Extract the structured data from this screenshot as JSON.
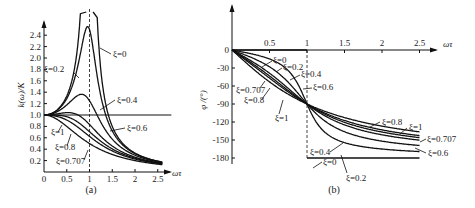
{
  "chart_data": [
    {
      "id": "a",
      "type": "line",
      "caption": "(a)",
      "title": "",
      "xlabel": "ωτ",
      "ylabel": "k(ω)/K",
      "xticks": [
        "0",
        "0.5",
        "1",
        "1.5",
        "2",
        "2.5"
      ],
      "yticks": [
        "0.2",
        "0.4",
        "0.6",
        "0.8",
        "1.0",
        "1.2",
        "1.4",
        "1.6",
        "1.8",
        "2.0",
        "2.2",
        "2.4"
      ],
      "xlim": [
        0,
        2.8
      ],
      "ylim": [
        0,
        2.6
      ],
      "grid": false,
      "reference_lines": [
        {
          "type": "vertical",
          "x": 1,
          "style": "dashed"
        },
        {
          "type": "horizontal",
          "y": 1.0,
          "style": "solid"
        }
      ],
      "series": [
        {
          "name": "ξ=0",
          "zeta": 0
        },
        {
          "name": "ξ=0.2",
          "zeta": 0.2
        },
        {
          "name": "ξ=0.4",
          "zeta": 0.4
        },
        {
          "name": "ξ=0.6",
          "zeta": 0.6
        },
        {
          "name": "ξ=0.707",
          "zeta": 0.707
        },
        {
          "name": "ξ=0.8",
          "zeta": 0.8
        },
        {
          "name": "ξ=1",
          "zeta": 1
        }
      ],
      "formula": "k(ω)/K = 1/sqrt((1-(ωτ)^2)^2 + (2ξωτ)^2)",
      "annotations": [
        "ξ=0",
        "ξ=0.2",
        "ξ=0.4",
        "ξ=0.6",
        "ξ=1",
        "ξ=0.8",
        "ξ=0.707"
      ]
    },
    {
      "id": "b",
      "type": "line",
      "caption": "(b)",
      "title": "",
      "xlabel": "ωτ",
      "ylabel": "φ /(°)",
      "xticks": [
        "0.5",
        "1",
        "1.5",
        "2",
        "2.5"
      ],
      "yticks": [
        "0",
        "-30",
        "-60",
        "-90",
        "-120",
        "-150",
        "-180"
      ],
      "xlim": [
        0,
        2.7
      ],
      "ylim": [
        -190,
        0
      ],
      "grid": false,
      "reference_lines": [
        {
          "type": "vertical",
          "x": 1,
          "style": "dashed"
        }
      ],
      "series": [
        {
          "name": "ξ=0",
          "zeta": 0
        },
        {
          "name": "ξ=0.2",
          "zeta": 0.2
        },
        {
          "name": "ξ=0.4",
          "zeta": 0.4
        },
        {
          "name": "ξ=0.6",
          "zeta": 0.6
        },
        {
          "name": "ξ=0.707",
          "zeta": 0.707
        },
        {
          "name": "ξ=0.8",
          "zeta": 0.8
        },
        {
          "name": "ξ=1",
          "zeta": 1
        }
      ],
      "formula": "φ = -arctan(2ξωτ/(1-(ωτ)^2))",
      "annotations": [
        "ξ=0",
        "ξ=0.2",
        "ξ=0.4",
        "ξ=0.6",
        "ξ=0.707",
        "ξ=0.8",
        "ξ=1",
        "ξ=0.8",
        "ξ=1",
        "ξ=0.707",
        "ξ=0.6",
        "ξ=0.4",
        "ξ=0",
        "ξ=0.2"
      ]
    }
  ],
  "labels": {
    "a": {
      "caption": "(a)",
      "xlabel": "ωτ",
      "ylabel": "k(ω)/K",
      "curve_labels": [
        {
          "text": "ξ=0",
          "x": 113,
          "y": 57,
          "lx1": 100,
          "ly1": 48,
          "lx2": 111,
          "ly2": 54
        },
        {
          "text": "ξ=0.2",
          "x": 44,
          "y": 72,
          "lx1": 73,
          "ly1": 72,
          "lx2": 79,
          "ly2": 78
        },
        {
          "text": "ξ=0.4",
          "x": 117,
          "y": 103,
          "lx1": 100,
          "ly1": 110,
          "lx2": 115,
          "ly2": 100
        },
        {
          "text": "ξ=0.6",
          "x": 127,
          "y": 131,
          "lx1": 110,
          "ly1": 131,
          "lx2": 125,
          "ly2": 128
        },
        {
          "text": "ξ=1",
          "x": 51,
          "y": 135,
          "lx1": 58,
          "ly1": 132,
          "lx2": 62,
          "ly2": 125
        },
        {
          "text": "ξ=0.8",
          "x": 55,
          "y": 150,
          "lx1": 67,
          "ly1": 146,
          "lx2": 71,
          "ly2": 134
        },
        {
          "text": "ξ=0.707",
          "x": 56,
          "y": 164,
          "lx1": 84,
          "ly1": 160,
          "lx2": 88,
          "ly2": 150
        }
      ]
    },
    "b": {
      "caption": "(b)",
      "xlabel": "ωτ",
      "ylabel": "φ /(°)",
      "curve_labels": [
        {
          "text": "ξ=0",
          "x": 273,
          "y": 63,
          "lx1": 262,
          "ly1": 67,
          "lx2": 272,
          "ly2": 61
        },
        {
          "text": "ξ=0.2",
          "x": 283,
          "y": 70,
          "lx1": 276,
          "ly1": 72,
          "lx2": 282,
          "ly2": 68
        },
        {
          "text": "ξ=0.4",
          "x": 301,
          "y": 77,
          "lx1": 290,
          "ly1": 80,
          "lx2": 300,
          "ly2": 75
        },
        {
          "text": "ξ=0.6",
          "x": 313,
          "y": 90,
          "lx1": 303,
          "ly1": 89,
          "lx2": 312,
          "ly2": 88
        },
        {
          "text": "ξ=0.707",
          "x": 236,
          "y": 93,
          "lx1": 260,
          "ly1": 88,
          "lx2": 265,
          "ly2": 81
        },
        {
          "text": "ξ=0.8",
          "x": 244,
          "y": 103,
          "lx1": 262,
          "ly1": 99,
          "lx2": 270,
          "ly2": 88
        },
        {
          "text": "ξ=1",
          "x": 275,
          "y": 121,
          "lx1": 279,
          "ly1": 114,
          "lx2": 283,
          "ly2": 100
        },
        {
          "text": "ξ=0.8",
          "x": 382,
          "y": 125,
          "lx1": 370,
          "ly1": 127,
          "lx2": 380,
          "ly2": 122
        },
        {
          "text": "ξ=1",
          "x": 409,
          "y": 130,
          "lx1": 400,
          "ly1": 134,
          "lx2": 407,
          "ly2": 128
        },
        {
          "text": "ξ=0.707",
          "x": 427,
          "y": 142,
          "lx1": 420,
          "ly1": 142,
          "lx2": 426,
          "ly2": 139
        },
        {
          "text": "ξ=0.6",
          "x": 428,
          "y": 156,
          "lx1": 415,
          "ly1": 148,
          "lx2": 426,
          "ly2": 153
        },
        {
          "text": "ξ=0.4",
          "x": 310,
          "y": 155,
          "lx1": 330,
          "ly1": 152,
          "lx2": 343,
          "ly2": 143
        },
        {
          "text": "ξ=0",
          "x": 323,
          "y": 165,
          "lx1": 313,
          "ly1": 168,
          "lx2": 322,
          "ly2": 162
        },
        {
          "text": "ξ=0.2",
          "x": 346,
          "y": 181,
          "lx1": 347,
          "ly1": 173,
          "lx2": 341,
          "ly2": 155
        }
      ]
    }
  }
}
